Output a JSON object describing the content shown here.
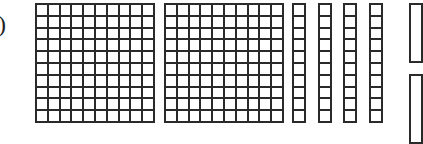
{
  "label": ")",
  "blocks": {
    "hundreds": [
      {
        "rows": 10,
        "cols": 10,
        "x": 35,
        "y": 3,
        "w": 120,
        "h": 120
      },
      {
        "rows": 10,
        "cols": 10,
        "x": 164,
        "y": 3,
        "w": 120,
        "h": 120
      }
    ],
    "tens": [
      {
        "rows": 10,
        "cols": 1,
        "x": 292,
        "y": 3,
        "w": 14,
        "h": 120
      },
      {
        "rows": 10,
        "cols": 1,
        "x": 318,
        "y": 3,
        "w": 14,
        "h": 120
      },
      {
        "rows": 10,
        "cols": 1,
        "x": 343,
        "y": 3,
        "w": 14,
        "h": 120
      },
      {
        "rows": 10,
        "cols": 1,
        "x": 369,
        "y": 3,
        "w": 14,
        "h": 120
      }
    ],
    "partial_right": [
      {
        "x": 409,
        "y": 3,
        "w": 14,
        "h": 60
      },
      {
        "x": 409,
        "y": 74,
        "w": 14,
        "h": 70
      }
    ]
  },
  "colors": {
    "line": "#2a2a2a",
    "fill": "#ffffff"
  }
}
